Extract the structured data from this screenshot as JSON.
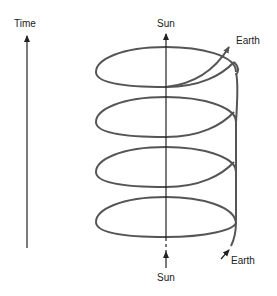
{
  "diagram": {
    "time_axis_label": "Time",
    "sun_top_label": "Sun",
    "sun_bottom_label": "Sun",
    "earth_top_label": "Earth",
    "earth_bottom_label": "Earth",
    "stroke_color": "#555555",
    "axis_color": "#222222",
    "helix_loops": 4
  }
}
